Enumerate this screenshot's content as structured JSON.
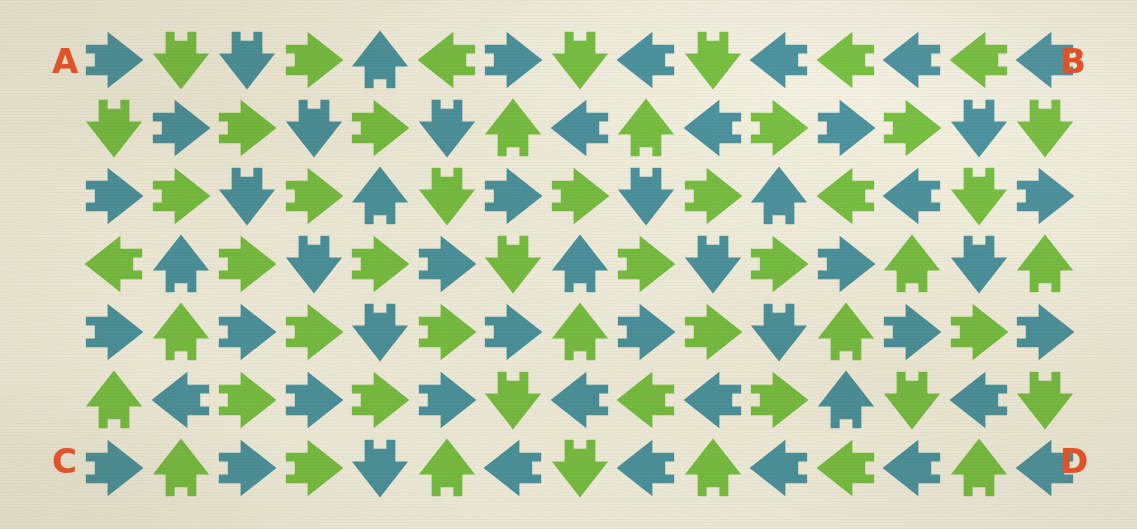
{
  "page": {
    "background_color": "#f4f1e2",
    "width": 1137,
    "height": 529
  },
  "palette": {
    "teal": "#4d94a1",
    "green": "#79c143",
    "letter_orange": "#e0522a",
    "paper_cream": "#f4f1e2"
  },
  "corner_labels": {
    "top_left": "A",
    "top_right": "B",
    "bottom_left": "C",
    "bottom_right": "D"
  },
  "grid": {
    "columns": 15,
    "rows": 7,
    "cell_size": 64,
    "origin_x": 82,
    "origin_y": 28,
    "step_x": 66.5,
    "step_y": 68,
    "color_rule": "checkerboard: teal when (row+col) even, green when odd",
    "rows_data": [
      {
        "row": 1,
        "directions": [
          "right",
          "down",
          "down",
          "right",
          "up",
          "left",
          "right",
          "down",
          "left",
          "down",
          "left",
          "left",
          "left",
          "left",
          "left"
        ],
        "colors": [
          "teal",
          "green",
          "teal",
          "green",
          "teal",
          "green",
          "teal",
          "green",
          "teal",
          "green",
          "teal",
          "green",
          "teal",
          "green",
          "teal"
        ]
      },
      {
        "row": 2,
        "directions": [
          "down",
          "right",
          "right",
          "down",
          "right",
          "down",
          "up",
          "left",
          "up",
          "left",
          "right",
          "right",
          "right",
          "down",
          "down"
        ],
        "colors": [
          "green",
          "teal",
          "green",
          "teal",
          "green",
          "teal",
          "green",
          "teal",
          "green",
          "teal",
          "green",
          "teal",
          "green",
          "teal",
          "green"
        ]
      },
      {
        "row": 3,
        "directions": [
          "right",
          "right",
          "down",
          "right",
          "up",
          "down",
          "right",
          "right",
          "down",
          "right",
          "up",
          "left",
          "left",
          "down",
          "right"
        ],
        "colors": [
          "teal",
          "green",
          "teal",
          "green",
          "teal",
          "green",
          "teal",
          "green",
          "teal",
          "green",
          "teal",
          "green",
          "teal",
          "green",
          "teal"
        ]
      },
      {
        "row": 4,
        "directions": [
          "left",
          "up",
          "right",
          "down",
          "right",
          "right",
          "down",
          "up",
          "right",
          "down",
          "right",
          "right",
          "up",
          "down",
          "up"
        ],
        "colors": [
          "green",
          "teal",
          "green",
          "teal",
          "green",
          "teal",
          "green",
          "teal",
          "green",
          "teal",
          "green",
          "teal",
          "green",
          "teal",
          "green"
        ]
      },
      {
        "row": 5,
        "directions": [
          "right",
          "up",
          "right",
          "right",
          "down",
          "right",
          "right",
          "up",
          "right",
          "right",
          "down",
          "up",
          "right",
          "right",
          "right"
        ],
        "colors": [
          "teal",
          "green",
          "teal",
          "green",
          "teal",
          "green",
          "teal",
          "green",
          "teal",
          "green",
          "teal",
          "green",
          "teal",
          "green",
          "teal"
        ]
      },
      {
        "row": 6,
        "directions": [
          "up",
          "left",
          "right",
          "right",
          "right",
          "right",
          "down",
          "left",
          "left",
          "left",
          "right",
          "up",
          "down",
          "left",
          "down"
        ],
        "colors": [
          "green",
          "teal",
          "green",
          "teal",
          "green",
          "teal",
          "green",
          "teal",
          "green",
          "teal",
          "green",
          "teal",
          "green",
          "teal",
          "green"
        ]
      },
      {
        "row": 7,
        "directions": [
          "right",
          "up",
          "right",
          "right",
          "down",
          "up",
          "left",
          "down",
          "left",
          "up",
          "left",
          "left",
          "left",
          "up",
          "left"
        ],
        "colors": [
          "teal",
          "green",
          "teal",
          "green",
          "teal",
          "green",
          "teal",
          "green",
          "teal",
          "green",
          "teal",
          "green",
          "teal",
          "green",
          "teal"
        ]
      }
    ]
  }
}
